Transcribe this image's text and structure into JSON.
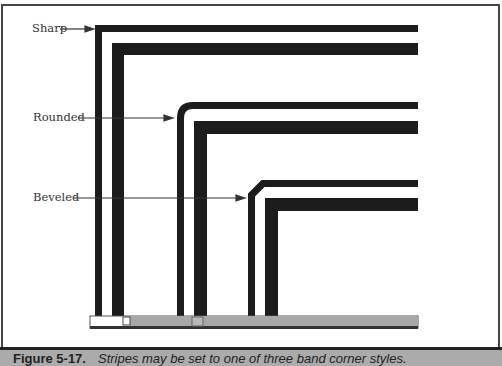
{
  "labels": {
    "sharp": "Sharp",
    "rounded": "Rounded",
    "beveled": "Beveled"
  },
  "caption": {
    "figure_number": "Figure 5-17.",
    "text": "Stripes may be set to one of three band corner styles."
  },
  "colors": {
    "stripe": "#1c1c1c",
    "scrollbar": "#a8a8a8",
    "caption_bg": "#ababab"
  },
  "corner_styles": [
    "sharp",
    "rounded",
    "beveled"
  ]
}
